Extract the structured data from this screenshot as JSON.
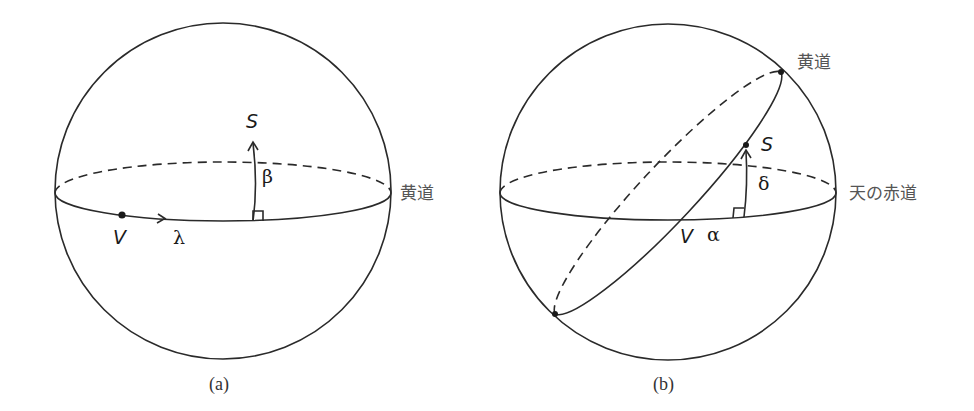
{
  "figure_a": {
    "caption": "(a)",
    "point_s": "S",
    "point_v": "V",
    "angle_beta": "β",
    "angle_lambda": "λ",
    "plane_label": "黄道"
  },
  "figure_b": {
    "caption": "(b)",
    "point_s": "S",
    "point_v": "V",
    "angle_delta": "δ",
    "angle_alpha": "α",
    "ecliptic_label": "黄道",
    "equator_label": "天の赤道"
  },
  "colors": {
    "stroke": "#2a2a2a",
    "label_jp": "#555555",
    "background": "#ffffff"
  }
}
